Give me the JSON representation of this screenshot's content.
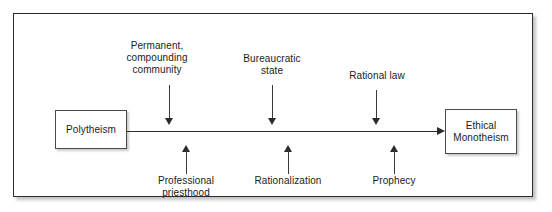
{
  "figure": {
    "kind": "process-flow-diagram",
    "orientation": "left-to-right",
    "border_color": "#2b2b2b",
    "line_color": "#2b2b2b",
    "background": "#ffffff"
  },
  "nodes": {
    "start": {
      "id": "polytheism",
      "label": "Polytheism"
    },
    "end": {
      "id": "ethical-monotheism",
      "label": "Ethical\nMonotheism"
    }
  },
  "factors_above": [
    {
      "id": "permanent-compounding-community",
      "label": "Permanent,\ncompounding\ncommunity",
      "direction": "down"
    },
    {
      "id": "bureaucratic-state",
      "label": "Bureaucratic\nstate",
      "direction": "down"
    },
    {
      "id": "rational-law",
      "label": "Rational law",
      "direction": "down"
    }
  ],
  "factors_below": [
    {
      "id": "professional-priesthood",
      "label": "Professional\npriesthood",
      "direction": "up"
    },
    {
      "id": "rationalization",
      "label": "Rationalization",
      "direction": "up"
    },
    {
      "id": "prophecy",
      "label": "Prophecy",
      "direction": "up"
    }
  ]
}
